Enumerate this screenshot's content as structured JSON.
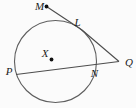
{
  "diagram": {
    "point_labels": {
      "M": "M",
      "L": "L",
      "X": "X",
      "P": "P",
      "N": "N",
      "Q": "Q"
    },
    "colors": {
      "line_stroke": "#4d4d4d",
      "circle_stroke": "#5e5e5e",
      "dot_fill": "#111111",
      "label_color": "#1c1c1c",
      "background": "#fbfbfb"
    }
  }
}
